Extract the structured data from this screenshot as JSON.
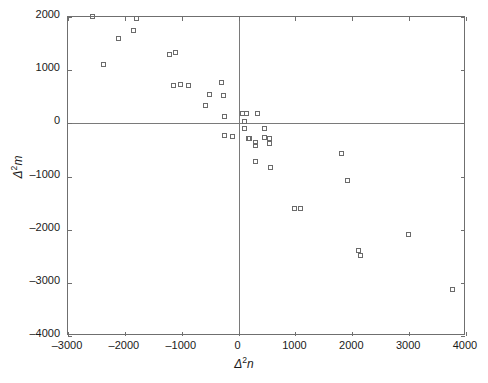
{
  "chart_data": {
    "type": "scatter",
    "title": "",
    "xlabel": "Δ²n",
    "ylabel": "Δ²m",
    "xlim": [
      -3000,
      4000
    ],
    "ylim": [
      -4000,
      2000
    ],
    "xticks": [
      -3000,
      -2000,
      -1000,
      0,
      1000,
      2000,
      3000,
      4000
    ],
    "xticklabels": [
      "-3000",
      "-2000",
      "-1000",
      "0",
      "1000",
      "2000",
      "3000",
      "4000"
    ],
    "yticks": [
      -4000,
      -3000,
      -2000,
      -1000,
      0,
      1000,
      2000
    ],
    "yticklabels": [
      "-4000",
      "-3000",
      "-2000",
      "-1000",
      "0",
      "1000",
      "2000"
    ],
    "grid": false,
    "legend": null,
    "marker": "open-square",
    "marker_color": "#6b6b6b",
    "zero_lines": {
      "x": 0,
      "y": 0
    },
    "points": [
      {
        "x": -2560,
        "y": 2000
      },
      {
        "x": -2370,
        "y": 1105
      },
      {
        "x": -2100,
        "y": 1580
      },
      {
        "x": -1840,
        "y": 1740
      },
      {
        "x": -1780,
        "y": 1960
      },
      {
        "x": -1200,
        "y": 1290
      },
      {
        "x": -1100,
        "y": 1330
      },
      {
        "x": -1130,
        "y": 705
      },
      {
        "x": -1010,
        "y": 725
      },
      {
        "x": -870,
        "y": 705
      },
      {
        "x": -300,
        "y": 760
      },
      {
        "x": -500,
        "y": 530
      },
      {
        "x": -260,
        "y": 510
      },
      {
        "x": -570,
        "y": 330
      },
      {
        "x": -240,
        "y": 120
      },
      {
        "x": -230,
        "y": -240
      },
      {
        "x": -90,
        "y": -260
      },
      {
        "x": 70,
        "y": 175
      },
      {
        "x": 140,
        "y": 175
      },
      {
        "x": 350,
        "y": 175
      },
      {
        "x": 105,
        "y": 20
      },
      {
        "x": 105,
        "y": -115
      },
      {
        "x": 470,
        "y": -115
      },
      {
        "x": 195,
        "y": -290
      },
      {
        "x": 470,
        "y": -270
      },
      {
        "x": 175,
        "y": -290
      },
      {
        "x": 300,
        "y": -370
      },
      {
        "x": 560,
        "y": -290
      },
      {
        "x": 310,
        "y": -430
      },
      {
        "x": 560,
        "y": -385
      },
      {
        "x": 300,
        "y": -720
      },
      {
        "x": 575,
        "y": -840
      },
      {
        "x": 990,
        "y": -1620
      },
      {
        "x": 1095,
        "y": -1620
      },
      {
        "x": 1825,
        "y": -580
      },
      {
        "x": 1930,
        "y": -1090
      },
      {
        "x": 2115,
        "y": -2400
      },
      {
        "x": 2150,
        "y": -2500
      },
      {
        "x": 3000,
        "y": -2100
      },
      {
        "x": 3775,
        "y": -3140
      }
    ]
  }
}
